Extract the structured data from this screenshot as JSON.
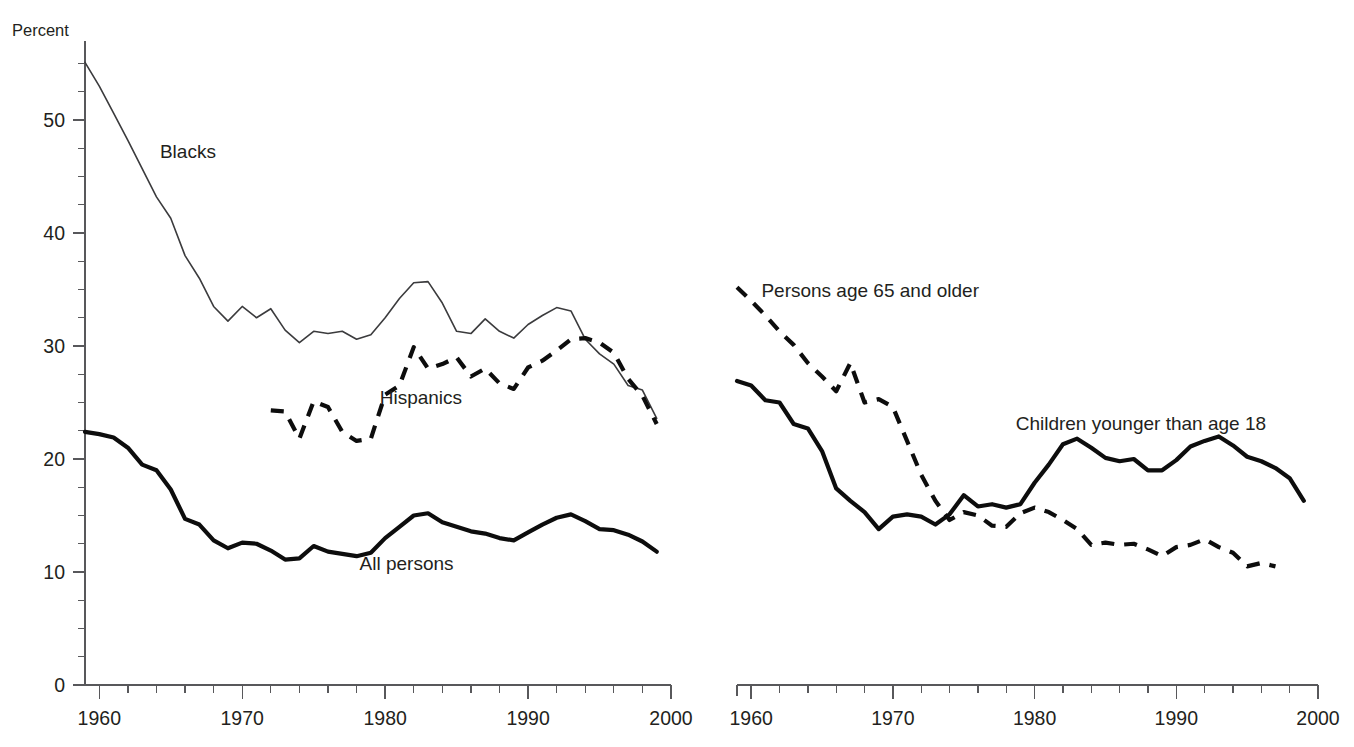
{
  "figure": {
    "y_axis_title": "Percent",
    "background": "#ffffff",
    "ink_color": "#231f20"
  },
  "chart_data": [
    {
      "type": "line",
      "panel": "left",
      "title": "",
      "xlabel": "",
      "ylabel": "Percent",
      "xlim": [
        1959,
        2000
      ],
      "ylim": [
        0,
        57
      ],
      "xticks": [
        1960,
        1970,
        1980,
        1990,
        2000
      ],
      "xtick_labels": [
        "1960",
        "1970",
        "1980",
        "1990",
        "2000"
      ],
      "xtick_minor_step": 2,
      "yticks": [
        0,
        10,
        20,
        30,
        40,
        50
      ],
      "ytick_labels": [
        "0",
        "10",
        "20",
        "30",
        "40",
        "50"
      ],
      "ytick_minor_step": 2.5,
      "grid": false,
      "legend_position": "inline-annotations",
      "series": [
        {
          "name": "Blacks",
          "style": "thin-solid",
          "label_x": 1966.2,
          "label_y": 46.6,
          "x": [
            1959,
            1960,
            1961,
            1962,
            1963,
            1964,
            1965,
            1966,
            1967,
            1968,
            1969,
            1970,
            1971,
            1972,
            1973,
            1974,
            1975,
            1976,
            1977,
            1978,
            1979,
            1980,
            1981,
            1982,
            1983,
            1984,
            1985,
            1986,
            1987,
            1988,
            1989,
            1990,
            1991,
            1992,
            1993,
            1994,
            1995,
            1996,
            1997,
            1998,
            1999
          ],
          "values": [
            55.1,
            53.0,
            50.6,
            48.2,
            45.7,
            43.2,
            41.3,
            38.0,
            36.0,
            33.5,
            32.2,
            33.5,
            32.5,
            33.3,
            31.4,
            30.3,
            31.3,
            31.1,
            31.3,
            30.6,
            31.0,
            32.5,
            34.2,
            35.6,
            35.7,
            33.8,
            31.3,
            31.1,
            32.4,
            31.3,
            30.7,
            31.9,
            32.7,
            33.4,
            33.1,
            30.6,
            29.3,
            28.4,
            26.5,
            26.1,
            23.6
          ]
        },
        {
          "name": "Hispanics",
          "style": "thick-dashed",
          "label_x": 1982.5,
          "label_y": 24.9,
          "x": [
            1972,
            1973,
            1974,
            1975,
            1976,
            1977,
            1978,
            1979,
            1980,
            1981,
            1982,
            1983,
            1984,
            1985,
            1986,
            1987,
            1988,
            1989,
            1990,
            1991,
            1992,
            1993,
            1994,
            1995,
            1996,
            1997,
            1998,
            1999
          ],
          "values": [
            24.3,
            24.2,
            21.8,
            25.1,
            24.6,
            22.4,
            21.6,
            21.8,
            25.7,
            26.5,
            29.9,
            28.0,
            28.4,
            29.0,
            27.3,
            28.0,
            26.7,
            26.2,
            28.1,
            28.7,
            29.6,
            30.6,
            30.7,
            30.3,
            29.4,
            27.1,
            25.6,
            23.1
          ]
        },
        {
          "name": "All persons",
          "style": "thick-solid",
          "label_x": 1981.5,
          "label_y": 10.2,
          "x": [
            1959,
            1960,
            1961,
            1962,
            1963,
            1964,
            1965,
            1966,
            1967,
            1968,
            1969,
            1970,
            1971,
            1972,
            1973,
            1974,
            1975,
            1976,
            1977,
            1978,
            1979,
            1980,
            1981,
            1982,
            1983,
            1984,
            1985,
            1986,
            1987,
            1988,
            1989,
            1990,
            1991,
            1992,
            1993,
            1994,
            1995,
            1996,
            1997,
            1998,
            1999
          ],
          "values": [
            22.4,
            22.2,
            21.9,
            21.0,
            19.5,
            19.0,
            17.3,
            14.7,
            14.2,
            12.8,
            12.1,
            12.6,
            12.5,
            11.9,
            11.1,
            11.2,
            12.3,
            11.8,
            11.6,
            11.4,
            11.7,
            13.0,
            14.0,
            15.0,
            15.2,
            14.4,
            14.0,
            13.6,
            13.4,
            13.0,
            12.8,
            13.5,
            14.2,
            14.8,
            15.1,
            14.5,
            13.8,
            13.7,
            13.3,
            12.7,
            11.8
          ]
        }
      ]
    },
    {
      "type": "line",
      "panel": "right",
      "title": "",
      "xlabel": "",
      "ylabel": "",
      "xlim": [
        1959,
        2000
      ],
      "ylim": [
        0,
        57
      ],
      "xticks": [
        1960,
        1970,
        1980,
        1990,
        2000
      ],
      "xtick_labels": [
        "1960",
        "1970",
        "1980",
        "1990",
        "2000"
      ],
      "xtick_minor_step": 2,
      "yticks": [],
      "ytick_labels": [],
      "grid": false,
      "legend_position": "inline-annotations",
      "series": [
        {
          "name": "Persons age 65 and older",
          "style": "thick-dashed",
          "label_x": 1968.4,
          "label_y": 34.3,
          "x": [
            1959,
            1960,
            1961,
            1962,
            1963,
            1964,
            1965,
            1966,
            1967,
            1968,
            1969,
            1970,
            1971,
            1972,
            1973,
            1974,
            1975,
            1976,
            1977,
            1978,
            1979,
            1980,
            1981,
            1982,
            1983,
            1984,
            1985,
            1986,
            1987,
            1988,
            1989,
            1990,
            1991,
            1992,
            1993,
            1994,
            1995,
            1996,
            1997
          ],
          "values": [
            35.2,
            34.0,
            32.7,
            31.3,
            30.1,
            28.5,
            27.3,
            26.0,
            28.5,
            25.0,
            25.3,
            24.6,
            21.6,
            18.6,
            16.3,
            14.6,
            15.3,
            15.0,
            14.1,
            14.0,
            15.2,
            15.7,
            15.3,
            14.6,
            13.8,
            12.4,
            12.6,
            12.4,
            12.5,
            12.0,
            11.4,
            12.2,
            12.4,
            12.9,
            12.2,
            11.7,
            10.5,
            10.8,
            10.5
          ]
        },
        {
          "name": "Children younger than age 18",
          "style": "thick-solid",
          "label_x": 1987.5,
          "label_y": 22.6,
          "x": [
            1959,
            1960,
            1961,
            1962,
            1963,
            1964,
            1965,
            1966,
            1967,
            1968,
            1969,
            1970,
            1971,
            1972,
            1973,
            1974,
            1975,
            1976,
            1977,
            1978,
            1979,
            1980,
            1981,
            1982,
            1983,
            1984,
            1985,
            1986,
            1987,
            1988,
            1989,
            1990,
            1991,
            1992,
            1993,
            1994,
            1995,
            1996,
            1997,
            1998,
            1999
          ],
          "values": [
            26.9,
            26.5,
            25.2,
            25.0,
            23.1,
            22.7,
            20.7,
            17.4,
            16.3,
            15.3,
            13.8,
            14.9,
            15.1,
            14.9,
            14.2,
            15.1,
            16.8,
            15.8,
            16.0,
            15.7,
            16.0,
            17.9,
            19.5,
            21.3,
            21.8,
            21.0,
            20.1,
            19.8,
            20.0,
            19.0,
            19.0,
            19.9,
            21.1,
            21.6,
            22.0,
            21.2,
            20.2,
            19.8,
            19.2,
            18.3,
            16.3
          ]
        }
      ]
    }
  ]
}
